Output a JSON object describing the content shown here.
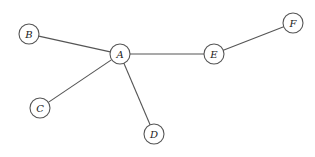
{
  "diagram": {
    "type": "undirected-graph",
    "colors": {
      "stroke": "#555555",
      "fill": "#ffffff",
      "text": "#222222"
    },
    "node_radius": 10,
    "nodes": [
      {
        "id": "A",
        "label": "A",
        "x": 120,
        "y": 54
      },
      {
        "id": "B",
        "label": "B",
        "x": 29,
        "y": 34
      },
      {
        "id": "C",
        "label": "C",
        "x": 40,
        "y": 108
      },
      {
        "id": "D",
        "label": "D",
        "x": 154,
        "y": 134
      },
      {
        "id": "E",
        "label": "E",
        "x": 214,
        "y": 54
      },
      {
        "id": "F",
        "label": "F",
        "x": 293,
        "y": 23
      }
    ],
    "edges": [
      {
        "from": "A",
        "to": "B"
      },
      {
        "from": "A",
        "to": "C"
      },
      {
        "from": "A",
        "to": "D"
      },
      {
        "from": "A",
        "to": "E"
      },
      {
        "from": "E",
        "to": "F"
      }
    ]
  }
}
